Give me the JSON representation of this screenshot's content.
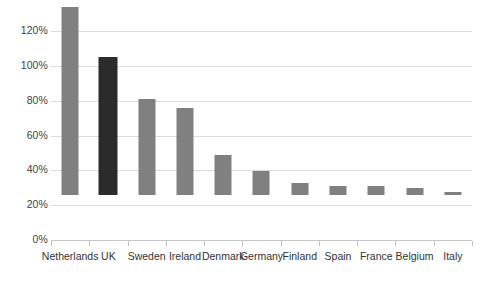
{
  "chart_data": {
    "type": "bar",
    "title": "",
    "subtitle": "",
    "xlabel": "",
    "ylabel": "",
    "categories": [
      "Netherlands",
      "UK",
      "Sweden",
      "Ireland",
      "Denmark",
      "Germany",
      "Finland",
      "Spain",
      "France",
      "Belgium",
      "Italy"
    ],
    "values": [
      108,
      79,
      55,
      50,
      23,
      14,
      7,
      5,
      5,
      4,
      2
    ],
    "value_suffix": "%",
    "series": [
      {
        "name": "",
        "values": [
          108,
          79,
          55,
          50,
          23,
          14,
          7,
          5,
          5,
          4,
          2
        ]
      }
    ],
    "highlight_index": 1,
    "ylim": [
      0,
      120
    ],
    "yticks": [
      0,
      20,
      40,
      60,
      80,
      100,
      120
    ],
    "ytick_labels": [
      "0%",
      "20%",
      "40%",
      "60%",
      "80%",
      "100%",
      "120%"
    ],
    "grid": true,
    "legend": "none",
    "colors": {
      "bar": "#808080",
      "bar_highlight": "#2b2b2b",
      "gridline": "#dcdcdc",
      "axis": "#c8c8c8",
      "tick": "#c0c0c0",
      "label_text": "#333333",
      "ytick_text": "#3f3f3f",
      "background": "#ffffff"
    }
  }
}
